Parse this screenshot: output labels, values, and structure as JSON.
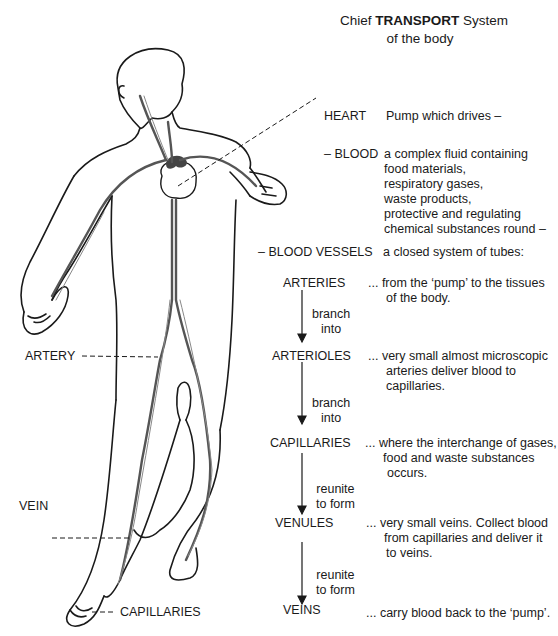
{
  "title": {
    "prefix": "Chief",
    "bold": "TRANSPORT",
    "suffix": "System",
    "line2": "of the body"
  },
  "components": {
    "heart": {
      "label": "HEART",
      "desc": "Pump which drives –"
    },
    "blood": {
      "label": "– BLOOD",
      "desc_lines": [
        "a complex fluid containing",
        "food materials,",
        "respiratory gases,",
        "waste products,",
        "protective and regulating",
        "chemical substances round –"
      ]
    },
    "vessels": {
      "label": "– BLOOD VESSELS",
      "desc": "a closed system of tubes:"
    }
  },
  "flow": [
    {
      "label": "ARTERIES",
      "desc_lines": [
        "... from the ‘pump’ to the tissues",
        "of the body."
      ]
    },
    {
      "connector": [
        "branch",
        "into"
      ]
    },
    {
      "label": "ARTERIOLES",
      "desc_lines": [
        "... very small almost microscopic",
        "arteries deliver blood to",
        "capillaries."
      ]
    },
    {
      "connector": [
        "branch",
        "into"
      ]
    },
    {
      "label": "CAPILLARIES",
      "desc_lines": [
        "... where the interchange of gases,",
        "food and waste substances",
        "occurs."
      ]
    },
    {
      "connector": [
        "reunite",
        "to form"
      ]
    },
    {
      "label": "VENULES",
      "desc_lines": [
        "... very small veins. Collect blood",
        "from capillaries and deliver it",
        "to veins."
      ]
    },
    {
      "connector": [
        "reunite",
        "to form"
      ]
    },
    {
      "label": "VEINS",
      "desc_lines": [
        "... carry blood back to the ‘pump’."
      ]
    }
  ],
  "figure_labels": {
    "artery": "ARTERY",
    "vein": "VEIN",
    "capillaries": "CAPILLARIES"
  },
  "colors": {
    "ink": "#1a1a1a",
    "vessel": "#555555",
    "background": "#ffffff"
  }
}
